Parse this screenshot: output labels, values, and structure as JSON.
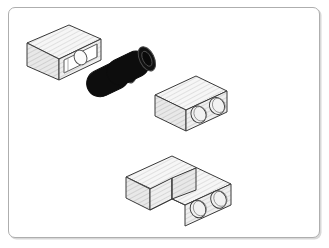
{
  "figure": {
    "kind": "technical-line-drawing",
    "style": "isometric patent illustration",
    "background_color": "#ffffff",
    "frame": {
      "border_color": "#aeaeae",
      "shadow_color": "#d8d8d8",
      "corner_radius_px": 7,
      "x": 8,
      "y": 7,
      "width": 312,
      "height": 231
    },
    "palette": {
      "outline": "#3a3a3a",
      "outline_light": "#6e6e6e",
      "hatch_line": "#c9c9c9",
      "face_light": "#f7f7f7",
      "face_mid": "#efefef",
      "face_dark": "#e4e4e4",
      "cylinder_body": "#0d0d0d",
      "cylinder_rim": "#2a2a2a",
      "cavity_fill": "#ffffff"
    },
    "objects": [
      {
        "id": "housing-block-open",
        "label": "Open housing block with cavity and roller",
        "position": "upper-left",
        "features": [
          "top-face",
          "left-face",
          "front-face",
          "rectangular-cavity",
          "internal-circle"
        ]
      },
      {
        "id": "roller-cylinder-front",
        "label": "Black cylindrical roller (front)",
        "position": "upper-center-left",
        "color": "#0d0d0d"
      },
      {
        "id": "roller-cylinder-rear",
        "label": "Black cylindrical roller (rear)",
        "position": "upper-center",
        "color": "#0d0d0d"
      },
      {
        "id": "boss-block-single",
        "label": "Block with two circular bosses",
        "position": "middle-right",
        "features": [
          "top-face",
          "left-face",
          "right-face",
          "boss-circle-1",
          "boss-circle-2"
        ]
      },
      {
        "id": "assembly-block-pair",
        "label": "Mated block assembly with two circular bosses",
        "position": "lower-center",
        "features": [
          "front-block",
          "rear-block",
          "seam-line",
          "boss-circle-1",
          "boss-circle-2"
        ]
      }
    ]
  }
}
